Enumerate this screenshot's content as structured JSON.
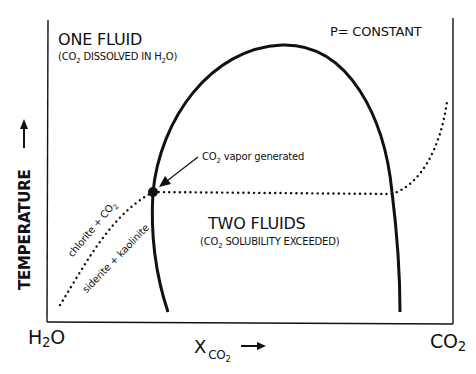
{
  "diagram": {
    "type": "phase diagram (T-X)",
    "condition_label": "P= CONSTANT",
    "regions": {
      "one_fluid": {
        "title": "ONE FLUID",
        "subtitle_pre": "(CO",
        "subtitle_sub": "2",
        "subtitle_mid": " DISSOLVED IN H",
        "subtitle_sub2": "2",
        "subtitle_post": "O)"
      },
      "two_fluids": {
        "title": "TWO FLUIDS",
        "subtitle_pre": "(CO",
        "subtitle_sub": "2",
        "subtitle_post": " SOLUBILITY EXCEEDED)"
      }
    },
    "annotation": {
      "pre": "CO",
      "sub": "2",
      "post": " vapor generated"
    },
    "reaction": {
      "upper": "chlorite + CO",
      "upper_sub": "2",
      "lower": "siderite + kaolinite"
    },
    "axes": {
      "y_label": "TEMPERATURE",
      "y_arrow": "→",
      "x_label_main": "X",
      "x_label_sub": "CO",
      "x_label_subsub": "2",
      "x_arrow": "→",
      "x_left_end": "H",
      "x_left_end_sub": "2",
      "x_left_end_post": "O",
      "x_right_end": "CO",
      "x_right_end_sub": "2"
    },
    "colors": {
      "ink": "#111111",
      "background": "#ffffff"
    }
  }
}
